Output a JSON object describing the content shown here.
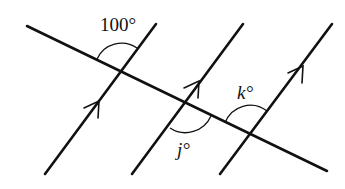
{
  "diagram": {
    "colors": {
      "stroke": "#111111",
      "background": "#ffffff"
    },
    "transversal": {
      "from": [
        27,
        26
      ],
      "to": [
        327,
        171
      ]
    },
    "parallel_lines": [
      {
        "id": "p1",
        "from": [
          45,
          174
        ],
        "to": [
          156,
          24
        ],
        "arrow_at": [
          91,
          112
        ]
      },
      {
        "id": "p2",
        "from": [
          132,
          174
        ],
        "to": [
          243,
          24
        ],
        "arrow_at": [
          191,
          92
        ]
      },
      {
        "id": "p3",
        "from": [
          220,
          174
        ],
        "to": [
          332,
          24
        ],
        "arrow_at": [
          301,
          65
        ]
      }
    ],
    "intersections": [
      {
        "id": "A",
        "point": [
          121,
          71
        ]
      },
      {
        "id": "B",
        "point": [
          186,
          104
        ]
      },
      {
        "id": "C",
        "point": [
          250,
          135
        ]
      }
    ],
    "angles": [
      {
        "id": "angle-100",
        "label": "100°",
        "at": "A",
        "position": "above, between transversal (left) and parallel line (up)"
      },
      {
        "id": "angle-j",
        "label": "j°",
        "at": "B",
        "position": "below, between parallel line (down) and transversal (right)"
      },
      {
        "id": "angle-k",
        "label": "k°",
        "at": "C",
        "position": "above, between transversal (left) and parallel line (up)"
      }
    ]
  }
}
